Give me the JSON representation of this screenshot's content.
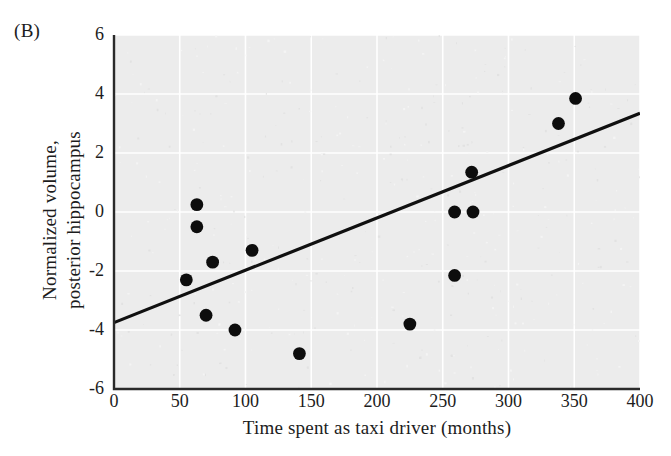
{
  "figure": {
    "panel_label": "(B)",
    "x_axis_title": "Time spent as taxi driver (months)",
    "y_axis_title_line1": "Normalized volume,",
    "y_axis_title_line2": "posterior hippocampus",
    "background_color": "#ececec",
    "gridline_color": "#ffffff",
    "point_color": "#0d0d0d",
    "line_color": "#101010"
  },
  "chart_data": {
    "type": "scatter",
    "title": "(B)",
    "xlabel": "Time spent as taxi driver (months)",
    "ylabel": "Normalized volume, posterior hippocampus",
    "xlim": [
      0,
      400
    ],
    "ylim": [
      -6,
      6
    ],
    "xticks": [
      0,
      50,
      100,
      150,
      200,
      250,
      300,
      350,
      400
    ],
    "xtick_labels": [
      "0",
      "50",
      "100",
      "150",
      "200",
      "250",
      "300",
      "350",
      "400"
    ],
    "yticks": [
      -6,
      -4,
      -2,
      0,
      2,
      4,
      6
    ],
    "ytick_labels": [
      "-6",
      "-4",
      "-2",
      "0",
      "2",
      "4",
      "6"
    ],
    "grid": true,
    "legend": "none",
    "series": [
      {
        "name": "Taxi drivers",
        "marker": "filled-circle",
        "points": [
          {
            "x": 63,
            "y": 0.25
          },
          {
            "x": 63,
            "y": -0.5
          },
          {
            "x": 75,
            "y": -1.7
          },
          {
            "x": 105,
            "y": -1.3
          },
          {
            "x": 55,
            "y": -2.3
          },
          {
            "x": 70,
            "y": -3.5
          },
          {
            "x": 92,
            "y": -4.0
          },
          {
            "x": 141,
            "y": -4.8
          },
          {
            "x": 225,
            "y": -3.8
          },
          {
            "x": 259,
            "y": -2.15
          },
          {
            "x": 259,
            "y": 0.0
          },
          {
            "x": 273,
            "y": 0.0
          },
          {
            "x": 272,
            "y": 1.35
          },
          {
            "x": 338,
            "y": 3.0
          },
          {
            "x": 351,
            "y": 3.85
          }
        ]
      }
    ],
    "trendline": {
      "name": "Linear regression fit",
      "x_start": 0,
      "y_start": -3.75,
      "x_end": 400,
      "y_end": 3.35,
      "slope": 0.01775,
      "intercept": -3.75
    }
  }
}
